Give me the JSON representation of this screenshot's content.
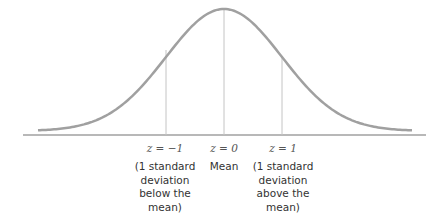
{
  "chart_data": {
    "type": "line",
    "title": "",
    "x": [
      -3,
      -2,
      -1,
      0,
      1,
      2,
      3
    ],
    "xlabel": "",
    "ylabel": "",
    "markers": [
      {
        "z": -1,
        "label": "z = −1",
        "caption": "(1 standard deviation below the mean)"
      },
      {
        "z": 0,
        "label": "z = 0",
        "caption": "Mean"
      },
      {
        "z": 1,
        "label": "z = 1",
        "caption": "(1 standard deviation above the mean)"
      }
    ],
    "colors": {
      "curve": "#9e9e9e",
      "lines": "#bdbdbd",
      "axis": "#b5b5b5"
    }
  },
  "labels": {
    "left": {
      "z": "z = −1",
      "line1": "(1 standard",
      "line2": "deviation",
      "line3": "below the",
      "line4": "mean)"
    },
    "center": {
      "z": "z = 0",
      "line1": "Mean"
    },
    "right": {
      "z": "z = 1",
      "line1": "(1 standard",
      "line2": "deviation",
      "line3": "above the",
      "line4": "mean)"
    }
  }
}
